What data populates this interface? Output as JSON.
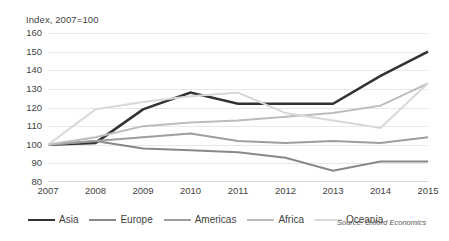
{
  "chart_data": {
    "type": "line",
    "title": "",
    "axis_note": "Index, 2007=100",
    "xlabel": "",
    "ylabel": "",
    "categories": [
      "2007",
      "2008",
      "2009",
      "2010",
      "2011",
      "2012",
      "2013",
      "2014",
      "2015"
    ],
    "x": [
      2007,
      2008,
      2009,
      2010,
      2011,
      2012,
      2013,
      2014,
      2015
    ],
    "ylim": [
      80,
      160
    ],
    "ytick_step": 10,
    "yticks": [
      80,
      90,
      100,
      110,
      120,
      130,
      140,
      150,
      160
    ],
    "grid": true,
    "grid_axis": "y",
    "legend_position": "bottom",
    "source": "Source: Oxford Economics",
    "series": [
      {
        "name": "Asia",
        "color": "#333333",
        "width": 2.6,
        "values": [
          100,
          101,
          119,
          128,
          122,
          122,
          122,
          137,
          150
        ]
      },
      {
        "name": "Europe",
        "color": "#888888",
        "width": 2.0,
        "values": [
          100,
          102,
          98,
          97,
          96,
          93,
          86,
          91,
          91
        ]
      },
      {
        "name": "Americas",
        "color": "#9e9e9e",
        "width": 2.0,
        "values": [
          100,
          102,
          104,
          106,
          102,
          101,
          102,
          101,
          104
        ]
      },
      {
        "name": "Africa",
        "color": "#bcbcbc",
        "width": 2.0,
        "values": [
          100,
          104,
          110,
          112,
          113,
          115,
          117,
          121,
          133
        ]
      },
      {
        "name": "Oceania",
        "color": "#d8d8d8",
        "width": 2.0,
        "values": [
          100,
          119,
          123,
          126,
          128,
          117,
          113,
          109,
          133
        ]
      }
    ]
  }
}
